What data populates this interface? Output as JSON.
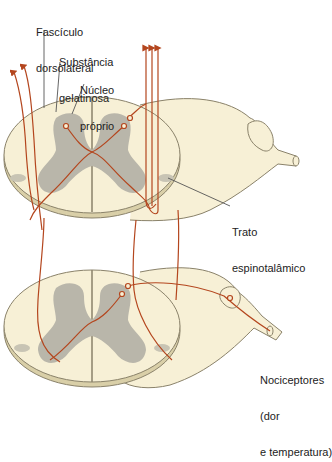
{
  "labels": {
    "fasciculo": [
      "Fascículo",
      "dorsolateral"
    ],
    "substancia": [
      "Substância",
      "gelatinosa"
    ],
    "nucleo": [
      "Núcleo",
      "próprio"
    ],
    "trato": [
      "Trato",
      "espinotalâmico"
    ],
    "nociceptores": [
      "Nociceptores",
      "(dor",
      "e temperatura)"
    ]
  },
  "colors": {
    "cord_fill": "#f7f0d6",
    "cord_edge": "#8a826a",
    "gray_matter": "#b9b6aa",
    "nerve_fill": "#f7f0d6",
    "fiber": "#b4461e",
    "leader": "#555555",
    "text": "#222222"
  },
  "segments": [
    {
      "name": "upper-spinal-segment"
    },
    {
      "name": "lower-spinal-segment"
    }
  ]
}
